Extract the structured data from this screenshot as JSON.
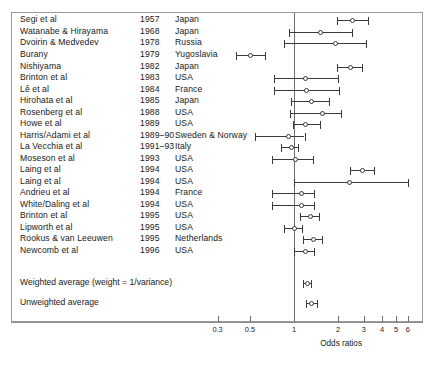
{
  "figure": {
    "axis_title": "Odds ratios",
    "frame_color": "#9a9a9a",
    "marker_color": "#3a3a3a",
    "null_line_value": 1
  },
  "columns": {
    "study": "Study",
    "year": "Year",
    "place": "Country"
  },
  "summary_rows": [
    {
      "label": "Weighted average (weight = 1/variance)",
      "y": 283,
      "or": 1.23,
      "low": 1.15,
      "high": 1.31
    },
    {
      "label": "Unweighted average",
      "y": 303,
      "or": 1.31,
      "low": 1.2,
      "high": 1.43
    }
  ],
  "chart_data": {
    "type": "forest",
    "title": "",
    "xlabel": "Odds ratios",
    "ylabel": "",
    "xscale": "log",
    "xlim": [
      0.25,
      7.0
    ],
    "xticks": [
      0.3,
      0.5,
      1,
      2,
      3,
      4,
      5,
      6
    ],
    "xticklabels": [
      "0.3",
      "0.5",
      "1",
      "2",
      "3",
      "4",
      "5",
      "6"
    ],
    "grid": false,
    "legend": null,
    "reference_line": 1,
    "categories": [
      "Segi et al",
      "Watanabe & Hirayama",
      "Dvoirin & Medvedev",
      "Burany",
      "Nishiyama",
      "Brinton et al",
      "Lê et al",
      "Hirohata et al",
      "Rosenberg et al",
      "Howe et al",
      "Harris/Adami et al",
      "La Vecchia et al",
      "Moseson et al",
      "Laing et al",
      "Laing et al",
      "Andrieu et al",
      "White/Daling et al",
      "Brinton et al",
      "Lipworth et al",
      "Rookus & van Leeuwen",
      "Newcomb et al"
    ],
    "rows": [
      {
        "study": "Segi et al",
        "year": "1957",
        "place": "Japan",
        "or": 2.51,
        "low": 1.97,
        "high": 3.19,
        "y": 20
      },
      {
        "study": "Watanabe & Hirayama",
        "year": "1968",
        "place": "Japan",
        "or": 1.52,
        "low": 0.92,
        "high": 2.49,
        "y": 32
      },
      {
        "study": "Dvoirin & Medvedev",
        "year": "1978",
        "place": "Russia",
        "or": 1.91,
        "low": 0.85,
        "high": 3.12,
        "y": 43
      },
      {
        "study": "Burany",
        "year": "1979",
        "place": "Yugoslavia",
        "or": 0.5,
        "low": 0.4,
        "high": 0.63,
        "y": 55
      },
      {
        "study": "Nishiyama",
        "year": "1982",
        "place": "Japan",
        "or": 2.42,
        "low": 1.96,
        "high": 2.93,
        "y": 67
      },
      {
        "study": "Brinton et al",
        "year": "1983",
        "place": "USA",
        "or": 1.2,
        "low": 0.73,
        "high": 2.0,
        "y": 78
      },
      {
        "study": "Lê et al",
        "year": "1984",
        "place": "France",
        "or": 1.21,
        "low": 0.73,
        "high": 2.02,
        "y": 90
      },
      {
        "study": "Hirohata et al",
        "year": "1985",
        "place": "Japan",
        "or": 1.32,
        "low": 0.95,
        "high": 1.73,
        "y": 101
      },
      {
        "study": "Rosenberg et al",
        "year": "1988",
        "place": "USA",
        "or": 1.56,
        "low": 0.94,
        "high": 2.1,
        "y": 113
      },
      {
        "study": "Howe et al",
        "year": "1989",
        "place": "USA",
        "or": 1.2,
        "low": 0.98,
        "high": 1.5,
        "y": 124
      },
      {
        "study": "Harris/Adami et al",
        "year": "1989–90",
        "place": "Sweden & Norway",
        "or": 0.92,
        "low": 0.54,
        "high": 1.18,
        "y": 136
      },
      {
        "study": "La Vecchia et al",
        "year": "1991–93",
        "place": "Italy",
        "or": 0.96,
        "low": 0.82,
        "high": 1.06,
        "y": 147
      },
      {
        "study": "Moseson et al",
        "year": "1993",
        "place": "USA",
        "or": 1.02,
        "low": 0.71,
        "high": 1.34,
        "y": 159
      },
      {
        "study": "Laing et al",
        "year": "1994",
        "place": "USA",
        "or": 2.92,
        "low": 2.4,
        "high": 3.55,
        "y": 170
      },
      {
        "study": "Laing et al",
        "year": "1994",
        "place": "USA",
        "or": 2.4,
        "low": 1.0,
        "high": 6.0,
        "y": 182
      },
      {
        "study": "Andrieu et al",
        "year": "1994",
        "place": "France",
        "or": 1.12,
        "low": 0.71,
        "high": 1.38,
        "y": 193
      },
      {
        "study": "White/Daling et al",
        "year": "1994",
        "place": "USA",
        "or": 1.12,
        "low": 0.71,
        "high": 1.38,
        "y": 205
      },
      {
        "study": "Brinton et al",
        "year": "1995",
        "place": "USA",
        "or": 1.29,
        "low": 1.1,
        "high": 1.48,
        "y": 216
      },
      {
        "study": "Lipworth et al",
        "year": "1995",
        "place": "USA",
        "or": 1.0,
        "low": 0.85,
        "high": 1.14,
        "y": 228
      },
      {
        "study": "Rookus & van Leeuwen",
        "year": "1995",
        "place": "Netherlands",
        "or": 1.35,
        "low": 1.15,
        "high": 1.55,
        "y": 239
      },
      {
        "study": "Newcomb et al",
        "year": "1996",
        "place": "USA",
        "or": 1.2,
        "low": 1.0,
        "high": 1.38,
        "y": 251
      }
    ],
    "summary": [
      {
        "study": "Weighted average (weight = 1/variance)",
        "or": 1.23,
        "low": 1.15,
        "high": 1.31,
        "y": 283
      },
      {
        "study": "Unweighted average",
        "or": 1.31,
        "low": 1.2,
        "high": 1.43,
        "y": 303
      }
    ]
  }
}
